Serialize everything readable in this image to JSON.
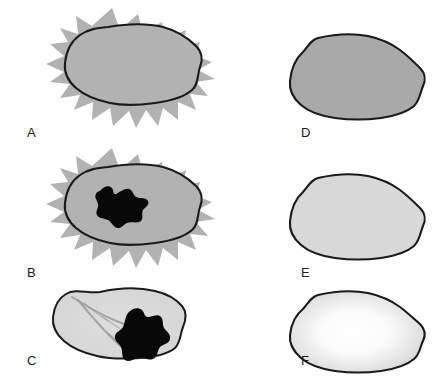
{
  "figure": {
    "type": "scientific-panel-figure",
    "layout": "2 columns x 3 rows",
    "background_color": "#ffffff",
    "panel_count": 6
  },
  "colors": {
    "halo_gray": "#b2b2b2",
    "core_gray": "#b2b2b2",
    "outline_dark": "#1a1a1a",
    "mass_black": "#080808",
    "fill_medium_gray": "#a9a9a9",
    "fill_light_gray": "#d8d8d8",
    "fill_pale_gray": "#dcdcdc",
    "gradient_center": "#ffffff",
    "gradient_edge": "#cfcfcf",
    "vessel_gray": "#9b9b9b",
    "label_color": "#1d1d1d"
  },
  "panels": [
    {
      "id": "A",
      "label": "A",
      "column": "left",
      "row": 1,
      "label_x": 27,
      "label_y": 137,
      "has_spiky_halo": true,
      "has_outlined_core": true,
      "has_black_mass": false,
      "has_vessels": false,
      "fill_style": "uniform-gray"
    },
    {
      "id": "B",
      "label": "B",
      "column": "left",
      "row": 2,
      "label_x": 27,
      "label_y": 277,
      "has_spiky_halo": true,
      "has_outlined_core": true,
      "has_black_mass": true,
      "has_vessels": false,
      "fill_style": "uniform-gray"
    },
    {
      "id": "C",
      "label": "C",
      "column": "left",
      "row": 3,
      "label_x": 27,
      "label_y": 365,
      "has_spiky_halo": false,
      "has_outlined_core": true,
      "has_black_mass": true,
      "has_vessels": true,
      "fill_style": "light-gray"
    },
    {
      "id": "D",
      "label": "D",
      "column": "right",
      "row": 1,
      "label_x": 301,
      "label_y": 137,
      "has_spiky_halo": false,
      "has_outlined_core": true,
      "has_black_mass": false,
      "has_vessels": false,
      "fill_style": "medium-gray"
    },
    {
      "id": "E",
      "label": "E",
      "column": "right",
      "row": 2,
      "label_x": 301,
      "label_y": 277,
      "has_spiky_halo": false,
      "has_outlined_core": true,
      "has_black_mass": false,
      "has_vessels": false,
      "fill_style": "pale-gray"
    },
    {
      "id": "F",
      "label": "F",
      "column": "right",
      "row": 3,
      "label_x": 301,
      "label_y": 365,
      "has_spiky_halo": false,
      "has_outlined_core": true,
      "has_black_mass": false,
      "has_vessels": false,
      "fill_style": "radial-gradient-white-center"
    }
  ],
  "shapes": {
    "halo_a": "M112 8 L120 30 L138 14 L143 33 L162 22 L164 40 L186 30 L183 46 L200 42 L196 56 L212 62 L198 70 L215 79 L196 82 L208 96 L190 94 L196 110 L178 102 L178 120 L163 108 L158 126 L146 110 L136 128 L129 111 L113 126 L110 108 L92 120 L93 102 L74 110 L80 95 L60 98 L70 84 L50 82 L64 72 L46 64 L64 56 L50 44 L68 42 L60 28 L78 34 L76 16 L92 26 Z",
    "core_a": "M108 27 C126 24 146 23 163 27 C178 31 188 38 196 46 C202 52 203 60 200 67 C197 75 199 84 192 90 C184 97 170 101 155 103 C140 105 124 106 110 103 C96 100 84 95 76 88 C68 81 64 72 65 63 C66 53 70 42 80 35 C88 29 98 28 108 27 Z",
    "halo_b": "M112 148 L120 170 L138 154 L143 173 L162 162 L164 180 L186 170 L183 186 L200 182 L196 196 L212 202 L198 210 L215 219 L196 222 L208 236 L190 234 L196 250 L178 242 L178 260 L163 248 L158 266 L146 250 L136 268 L129 251 L113 266 L110 248 L92 260 L93 242 L74 250 L80 235 L60 238 L70 224 L50 222 L64 212 L46 204 L64 196 L50 184 L68 182 L60 168 L78 174 L76 156 L92 166 Z",
    "core_b": "M108 167 C126 164 146 163 163 167 C178 171 188 178 196 186 C202 192 203 200 200 207 C197 215 199 224 192 230 C184 237 170 241 155 243 C140 245 124 246 110 243 C96 240 84 235 76 228 C68 221 64 212 65 203 C66 193 70 182 80 175 C88 169 98 168 108 167 Z",
    "mass_b": "M101 190 C104 186 109 185 112 188 C114 191 113 195 116 194 C120 192 125 188 129 189 C133 190 133 195 136 197 C140 199 146 197 148 201 C150 205 145 207 143 210 C141 214 144 218 141 221 C137 224 131 221 127 223 C123 225 121 229 117 228 C113 227 112 222 108 220 C104 218 99 219 97 215 C95 211 99 208 98 204 C97 200 94 197 96 194 C97 191 99 192 101 190 Z",
    "core_c": "M100 292 C118 288 138 287 155 291 C168 294 176 299 182 306 C187 312 186 320 183 327 C180 334 181 342 175 348 C168 354 154 357 140 358 C125 359 110 359 97 356 C84 353 72 348 64 341 C56 334 52 326 53 317 C54 308 57 299 66 294 C76 288 88 294 100 292 Z",
    "mass_c": "M128 313 C132 308 138 307 142 310 C145 313 144 317 148 317 C152 317 157 314 160 316 C164 319 162 324 164 328 C167 332 171 334 170 339 C169 344 163 344 160 347 C157 351 158 357 153 359 C148 361 143 357 138 358 C133 359 129 363 125 360 C121 357 123 351 121 347 C119 343 114 341 115 336 C116 331 121 331 123 327 C125 323 125 317 128 313 Z",
    "vessels": [
      "M72 297 C86 306 100 314 114 320 C126 325 136 329 146 331",
      "M78 300 C88 312 98 324 108 334 C115 341 121 347 127 352",
      "M102 316 C110 322 118 328 126 332",
      "M108 333 C114 339 120 344 126 348",
      "M84 303 C92 310 100 316 108 321"
    ],
    "blob_d": "M318 38 C335 34 352 33 368 36 C382 39 392 44 400 50 C408 56 414 62 420 68 C425 73 426 80 423 86 C420 93 420 100 414 106 C407 112 395 116 381 118 C366 120 350 120 335 118 C321 116 309 112 301 105 C293 98 289 90 290 81 C291 71 294 60 303 52 C309 45 311 40 318 38 Z",
    "blob_e": "M318 178 C335 174 352 173 368 176 C382 179 392 184 400 190 C408 196 414 202 420 208 C425 213 426 220 423 226 C420 233 420 240 414 246 C407 252 395 256 381 258 C366 260 350 260 335 258 C321 256 309 252 301 245 C293 238 289 230 290 221 C291 211 294 200 303 192 C309 185 311 180 318 178 Z",
    "blob_f": "M318 295 C335 291 352 290 368 293 C382 296 392 301 400 307 C408 313 414 319 420 324 C425 329 426 335 423 341 C420 347 420 354 414 359 C407 365 395 369 381 371 C366 373 350 373 335 371 C321 369 309 365 301 358 C293 351 289 344 290 335 C291 326 294 316 303 309 C309 302 311 297 318 295 Z"
  }
}
